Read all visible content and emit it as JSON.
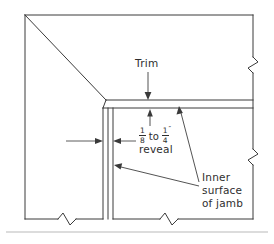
{
  "drawing": {
    "type": "architectural-section-detail",
    "subject": "Door jamb trim reveal detail",
    "labels": {
      "trim": "Trim",
      "reveal_min_numerator": "1",
      "reveal_min_denominator": "8",
      "reveal_connector": "to",
      "reveal_max_numerator": "1",
      "reveal_max_denominator": "4",
      "reveal_inch_mark": "″",
      "reveal_word": "reveal",
      "jamb_line_1": "Inner",
      "jamb_line_2": "surface",
      "jamb_line_3": "of jamb"
    },
    "colors": {
      "line": "#3a3a3a",
      "thin_line": "#4a4a4a",
      "text": "#2e2e2e",
      "background": "#ffffff",
      "baseline_rule": "#b9b9b9"
    },
    "dimension": {
      "annotation": "1/8 to 1/4″ reveal",
      "min_value": "1/8",
      "max_value": "1/4",
      "unit": "inch"
    },
    "break_symbols": {
      "count": 4,
      "positions": [
        "right-upper",
        "right-lower",
        "bottom-left",
        "bottom-right"
      ]
    }
  }
}
